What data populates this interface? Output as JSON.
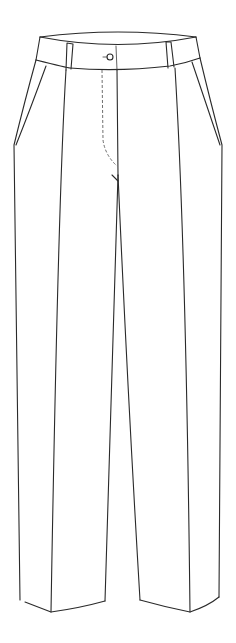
{
  "figure": {
    "view": "front",
    "background": "#ffffff",
    "stroke_color": "#2a2a2a",
    "features": [
      "waistband",
      "belt-loop-left",
      "belt-loop-right",
      "button",
      "fly-stitching",
      "side-pockets",
      "front-creases",
      "hems"
    ]
  }
}
